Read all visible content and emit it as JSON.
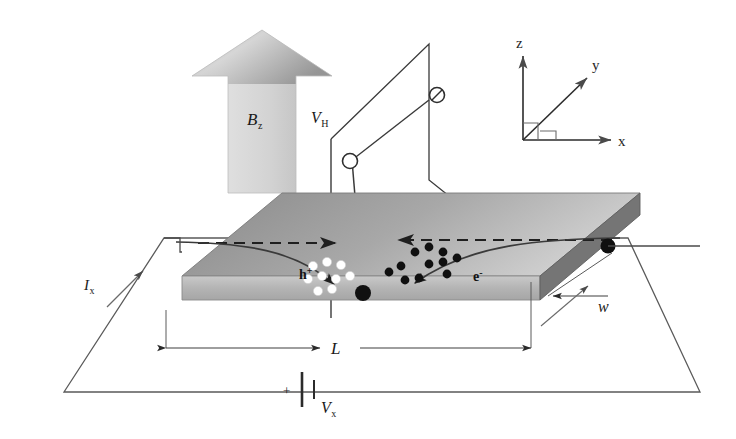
{
  "figure": {
    "background": "#ffffff",
    "width": 736,
    "height": 439
  },
  "colors": {
    "ink": "#1a1a1a",
    "line": "#3a3a3a",
    "slab_top_dark": "#8d8d8d",
    "slab_top_light": "#d6d6d6",
    "slab_front": "#b9b9b9",
    "slab_side": "#6e6e6e",
    "arrow_fill_light": "#dcdcdc",
    "arrow_fill_dark": "#9a9a9a",
    "hole_dot": "#ffffff",
    "electron_dot": "#101010",
    "probe_dot": "#101010"
  },
  "labels": {
    "magnetic_field": {
      "symbol": "B",
      "subscript": "z"
    },
    "hall_voltage": {
      "symbol": "V",
      "subscript": "H"
    },
    "source_voltage": {
      "symbol": "V",
      "subscript": "x"
    },
    "current": {
      "symbol": "I",
      "subscript": "x"
    },
    "length": "L",
    "width": "w",
    "holes": "h",
    "holes_sign": "+",
    "electrons": "e",
    "electrons_sign": "-",
    "battery_polarity": "+"
  },
  "axes": {
    "z": "z",
    "y": "y",
    "x": "x"
  },
  "carriers": {
    "holes": {
      "label": "h+",
      "color": "#ffffff",
      "count": 9,
      "positions": [
        [
          313,
          266
        ],
        [
          327,
          262
        ],
        [
          341,
          265
        ],
        [
          308,
          279
        ],
        [
          322,
          276
        ],
        [
          336,
          279
        ],
        [
          350,
          276
        ],
        [
          318,
          291
        ],
        [
          332,
          289
        ]
      ],
      "drift_direction": "left-to-right",
      "deflection": "down-right"
    },
    "electrons": {
      "label": "e-",
      "color": "#101010",
      "count": 11,
      "positions": [
        [
          415,
          252
        ],
        [
          429,
          247
        ],
        [
          443,
          252
        ],
        [
          401,
          266
        ],
        [
          429,
          264
        ],
        [
          443,
          262
        ],
        [
          457,
          258
        ],
        [
          389,
          272
        ],
        [
          405,
          280
        ],
        [
          419,
          278
        ],
        [
          447,
          274
        ]
      ],
      "drift_direction": "right-to-left",
      "deflection": "down-left"
    }
  },
  "annotations": {
    "dashed_arrow_left": "hole drift direction arrow",
    "dashed_arrow_right": "electron drift direction arrow",
    "curve_left": "hole deflection trajectory",
    "curve_right": "electron deflection trajectory"
  }
}
